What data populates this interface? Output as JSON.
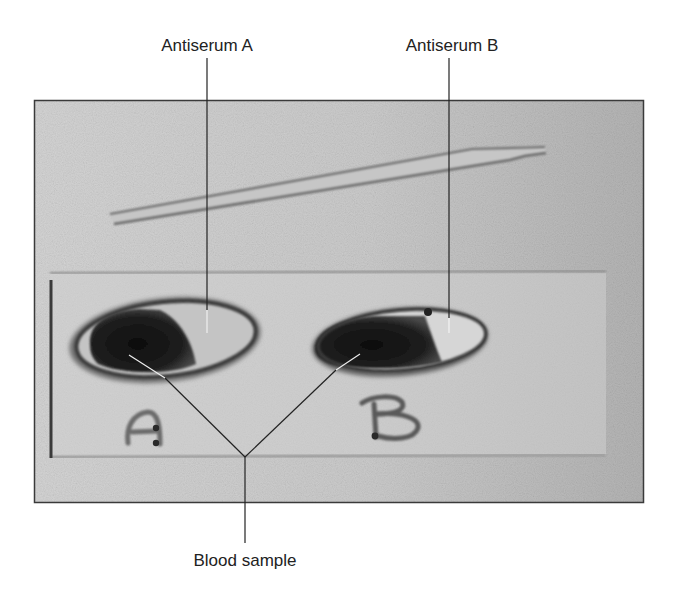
{
  "figure": {
    "labels": {
      "antiserum_a": "Antiserum A",
      "antiserum_b": "Antiserum B",
      "blood_sample": "Blood sample"
    },
    "slide_marks": {
      "well_a": "A",
      "well_b": "B"
    },
    "colors": {
      "background": "#ffffff",
      "photo_light": "#d2d2d2",
      "photo_dark": "#b6b6b6",
      "blood": "#1c1c1c",
      "antiserum": "#c8c8c8",
      "leader_line": "#222222"
    }
  }
}
